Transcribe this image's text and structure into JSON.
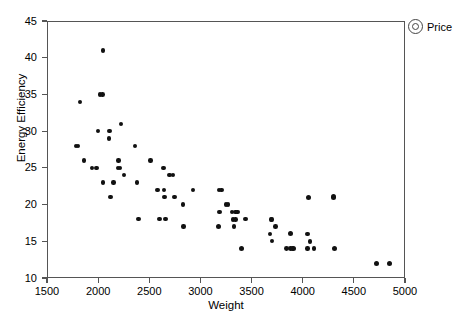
{
  "chart_data": {
    "type": "scatter",
    "title": "",
    "xlabel": "Weight",
    "ylabel": "Energy Efficiency",
    "xlim": [
      1500,
      5000
    ],
    "ylim": [
      10,
      45
    ],
    "xticks": [
      1500,
      2000,
      2500,
      3000,
      3500,
      4000,
      4500,
      5000
    ],
    "yticks": [
      10,
      15,
      20,
      25,
      30,
      35,
      40,
      45
    ],
    "grid": false,
    "legend": {
      "position": "top-right-outside",
      "entries": [
        {
          "label": "Price",
          "marker": "circle",
          "size_encodes": "Price"
        }
      ]
    },
    "series": [
      {
        "name": "Price",
        "marker": "filled-circle",
        "color": "#111111",
        "points": [
          {
            "x": 1780,
            "y": 28,
            "size": 4.0
          },
          {
            "x": 1800,
            "y": 28,
            "size": 4.0
          },
          {
            "x": 1820,
            "y": 34,
            "size": 4.0
          },
          {
            "x": 1860,
            "y": 26,
            "size": 4.0
          },
          {
            "x": 1940,
            "y": 25,
            "size": 4.0
          },
          {
            "x": 1985,
            "y": 25,
            "size": 4.2
          },
          {
            "x": 2000,
            "y": 30,
            "size": 4.2
          },
          {
            "x": 2020,
            "y": 35,
            "size": 4.4
          },
          {
            "x": 2045,
            "y": 35,
            "size": 4.4
          },
          {
            "x": 2045,
            "y": 41,
            "size": 4.2
          },
          {
            "x": 2050,
            "y": 23,
            "size": 4.2
          },
          {
            "x": 2110,
            "y": 30,
            "size": 4.2
          },
          {
            "x": 2110,
            "y": 29,
            "size": 4.0
          },
          {
            "x": 2120,
            "y": 21,
            "size": 4.0
          },
          {
            "x": 2150,
            "y": 23,
            "size": 4.2
          },
          {
            "x": 2195,
            "y": 25,
            "size": 4.4
          },
          {
            "x": 2215,
            "y": 25,
            "size": 4.4
          },
          {
            "x": 2200,
            "y": 26,
            "size": 4.2
          },
          {
            "x": 2225,
            "y": 31,
            "size": 4.2
          },
          {
            "x": 2255,
            "y": 24,
            "size": 4.2
          },
          {
            "x": 2360,
            "y": 28,
            "size": 4.2
          },
          {
            "x": 2380,
            "y": 23,
            "size": 4.2
          },
          {
            "x": 2395,
            "y": 18,
            "size": 4.2
          },
          {
            "x": 2510,
            "y": 26,
            "size": 4.2
          },
          {
            "x": 2580,
            "y": 22,
            "size": 4.2
          },
          {
            "x": 2600,
            "y": 18,
            "size": 4.2
          },
          {
            "x": 2640,
            "y": 25,
            "size": 4.2
          },
          {
            "x": 2645,
            "y": 22,
            "size": 4.2
          },
          {
            "x": 2650,
            "y": 21,
            "size": 4.2
          },
          {
            "x": 2660,
            "y": 18,
            "size": 4.2
          },
          {
            "x": 2700,
            "y": 24,
            "size": 4.4
          },
          {
            "x": 2730,
            "y": 24,
            "size": 4.4
          },
          {
            "x": 2745,
            "y": 21,
            "size": 4.2
          },
          {
            "x": 2830,
            "y": 20,
            "size": 4.2
          },
          {
            "x": 2835,
            "y": 17,
            "size": 4.2
          },
          {
            "x": 2930,
            "y": 22,
            "size": 4.2
          },
          {
            "x": 3180,
            "y": 22,
            "size": 4.2
          },
          {
            "x": 3205,
            "y": 22,
            "size": 4.2
          },
          {
            "x": 3185,
            "y": 19,
            "size": 4.4
          },
          {
            "x": 3180,
            "y": 17,
            "size": 4.8
          },
          {
            "x": 3250,
            "y": 20,
            "size": 4.4
          },
          {
            "x": 3270,
            "y": 20,
            "size": 4.4
          },
          {
            "x": 3310,
            "y": 19,
            "size": 4.4
          },
          {
            "x": 3340,
            "y": 19,
            "size": 4.4
          },
          {
            "x": 3360,
            "y": 19,
            "size": 4.4
          },
          {
            "x": 3320,
            "y": 18,
            "size": 4.4
          },
          {
            "x": 3345,
            "y": 18,
            "size": 4.4
          },
          {
            "x": 3330,
            "y": 17,
            "size": 4.2
          },
          {
            "x": 3400,
            "y": 14,
            "size": 5.2
          },
          {
            "x": 3440,
            "y": 18,
            "size": 4.2
          },
          {
            "x": 3690,
            "y": 18,
            "size": 4.6
          },
          {
            "x": 3700,
            "y": 18,
            "size": 4.6
          },
          {
            "x": 3680,
            "y": 16,
            "size": 4.2
          },
          {
            "x": 3735,
            "y": 17,
            "size": 4.4
          },
          {
            "x": 3700,
            "y": 15,
            "size": 4.2
          },
          {
            "x": 3840,
            "y": 14,
            "size": 4.6
          },
          {
            "x": 3880,
            "y": 14,
            "size": 4.6
          },
          {
            "x": 3905,
            "y": 14,
            "size": 5.2
          },
          {
            "x": 3880,
            "y": 16,
            "size": 4.8
          },
          {
            "x": 4045,
            "y": 16,
            "size": 4.6
          },
          {
            "x": 4060,
            "y": 21,
            "size": 5.0
          },
          {
            "x": 4070,
            "y": 15,
            "size": 4.4
          },
          {
            "x": 4045,
            "y": 14,
            "size": 4.2
          },
          {
            "x": 4110,
            "y": 14,
            "size": 4.4
          },
          {
            "x": 4300,
            "y": 21,
            "size": 5.4
          },
          {
            "x": 4310,
            "y": 14,
            "size": 4.8
          },
          {
            "x": 4720,
            "y": 12,
            "size": 4.8
          },
          {
            "x": 4850,
            "y": 12,
            "size": 4.8
          }
        ]
      }
    ]
  },
  "axes": {
    "y_tick_labels": [
      "45",
      "40",
      "35",
      "30",
      "25",
      "20",
      "15",
      "10"
    ],
    "x_tick_labels": [
      "1500",
      "2000",
      "2500",
      "3000",
      "3500",
      "4000",
      "4500",
      "5000"
    ],
    "y_axis_title": "Energy Efficiency",
    "x_axis_title": "Weight"
  },
  "legend": {
    "label": "Price"
  }
}
